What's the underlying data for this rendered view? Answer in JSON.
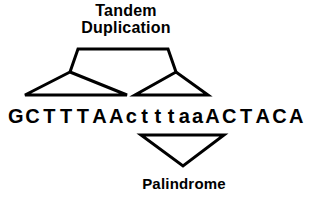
{
  "figure": {
    "background_color": "#ffffff",
    "stroke_color": "#000000"
  },
  "top_label": {
    "line1": "Tandem",
    "line2": "Duplication"
  },
  "bottom_label": {
    "text": "Palindrome"
  },
  "sequence": {
    "full": "GCTTTAActtttaaACTACA",
    "bases": [
      {
        "char": "G",
        "case": "upper"
      },
      {
        "char": "C",
        "case": "upper"
      },
      {
        "char": "T",
        "case": "upper"
      },
      {
        "char": "T",
        "case": "upper"
      },
      {
        "char": "T",
        "case": "upper"
      },
      {
        "char": "A",
        "case": "upper"
      },
      {
        "char": "A",
        "case": "upper"
      },
      {
        "char": "c",
        "case": "lower"
      },
      {
        "char": "t",
        "case": "lower"
      },
      {
        "char": "t",
        "case": "lower"
      },
      {
        "char": "t",
        "case": "lower"
      },
      {
        "char": "a",
        "case": "lower"
      },
      {
        "char": "a",
        "case": "lower"
      },
      {
        "char": "A",
        "case": "upper"
      },
      {
        "char": "C",
        "case": "upper"
      },
      {
        "char": "T",
        "case": "upper"
      },
      {
        "char": "A",
        "case": "upper"
      },
      {
        "char": "C",
        "case": "upper"
      },
      {
        "char": "A",
        "case": "upper"
      }
    ]
  },
  "annotations": {
    "tandem_duplication_bracket": "spans the two repeated segments above the sequence",
    "palindrome_bracket": "downward triangle below the central palindromic segment"
  }
}
